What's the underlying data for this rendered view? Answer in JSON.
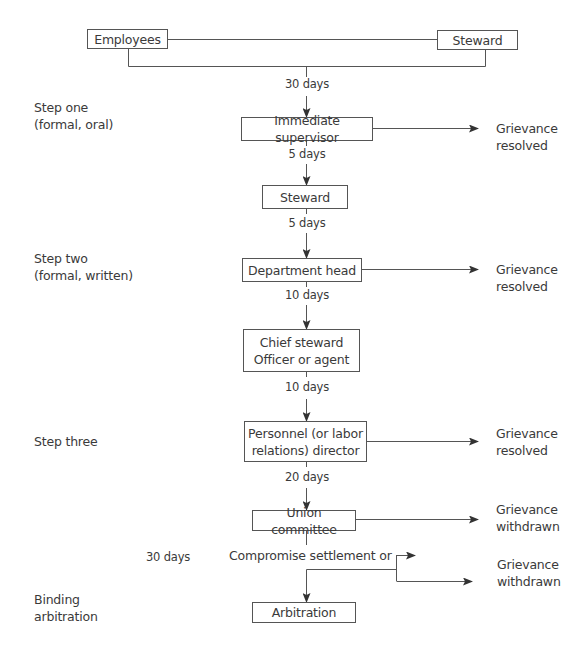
{
  "diagram": {
    "type": "flowchart",
    "colors": {
      "line": "#555555",
      "text": "#3a3a3a",
      "background": "#ffffff"
    },
    "initiators": [
      {
        "id": "employees",
        "label": "Employees"
      },
      {
        "id": "steward_top",
        "label": "Steward"
      }
    ],
    "steps": [
      {
        "label_line1": "Step one",
        "label_line2": "(formal, oral)"
      },
      {
        "label_line1": "Step two",
        "label_line2": "(formal, written)"
      },
      {
        "label_line1": "Step three"
      },
      {
        "label_line1": "Binding",
        "label_line2": "arbitration"
      }
    ],
    "nodes": {
      "immediate_supervisor": "Immediate supervisor",
      "steward": "Steward",
      "department_head": "Department head",
      "chief_steward_line1": "Chief steward",
      "chief_steward_line2": "Officer or agent",
      "personnel_line1": "Personnel (or labor",
      "personnel_line2": "relations) director",
      "union_committee": "Union committee",
      "arbitration": "Arbitration"
    },
    "time_limits": {
      "to_supervisor": "30 days",
      "to_steward": "5 days",
      "to_department_head": "5 days",
      "to_chief_steward": "10 days",
      "to_personnel": "10 days",
      "to_union_committee": "20 days",
      "to_arbitration": "30 days"
    },
    "compromise_label": "Compromise settlement or",
    "outcomes": {
      "resolved_1_line1": "Grievance",
      "resolved_1_line2": "resolved",
      "resolved_2_line1": "Grievance",
      "resolved_2_line2": "resolved",
      "resolved_3_line1": "Grievance",
      "resolved_3_line2": "resolved",
      "withdrawn_1_line1": "Grievance",
      "withdrawn_1_line2": "withdrawn",
      "withdrawn_2_line1": "Grievance",
      "withdrawn_2_line2": "withdrawn"
    },
    "edges": [
      [
        "employees+steward_top",
        "immediate_supervisor",
        "30 days"
      ],
      [
        "immediate_supervisor",
        "steward",
        "5 days"
      ],
      [
        "immediate_supervisor",
        "Grievance resolved",
        ""
      ],
      [
        "steward",
        "department_head",
        "5 days"
      ],
      [
        "department_head",
        "chief_steward",
        "10 days"
      ],
      [
        "department_head",
        "Grievance resolved",
        ""
      ],
      [
        "chief_steward",
        "personnel",
        "10 days"
      ],
      [
        "personnel",
        "union_committee",
        "20 days"
      ],
      [
        "personnel",
        "Grievance resolved",
        ""
      ],
      [
        "union_committee",
        "Grievance withdrawn",
        ""
      ],
      [
        "union_committee",
        "arbitration",
        "30 days"
      ],
      [
        "union_committee",
        "Grievance withdrawn (compromise)",
        ""
      ]
    ]
  }
}
